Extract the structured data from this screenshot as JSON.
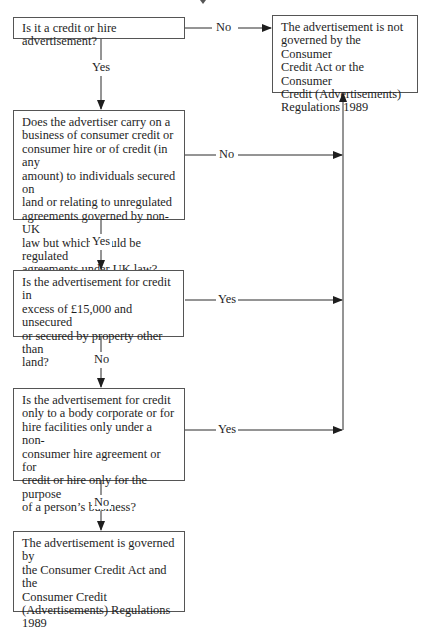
{
  "diagram": {
    "type": "flowchart",
    "title_fragment": "",
    "colors": {
      "line": "#2a2a2a",
      "box_border": "#555555",
      "text": "#1e1e1e",
      "background": "#ffffff"
    },
    "nodes": [
      {
        "id": "q1",
        "kind": "decision",
        "text": "Is it a credit or hire advertisement?"
      },
      {
        "id": "q2",
        "kind": "decision",
        "text": "Does the advertiser carry on a\nbusiness of consumer credit or\nconsumer hire or of credit (in any\namount) to individuals secured on\nland or relating to unregulated\nagreements governed by non-UK\nlaw but which would be regulated\nagreements under UK law?"
      },
      {
        "id": "q3",
        "kind": "decision",
        "text": "Is the advertisement for credit in\nexcess of £15,000 and unsecured\nor secured by property other than\nland?"
      },
      {
        "id": "q4",
        "kind": "decision",
        "text": "Is the advertisement for credit\nonly to a body corporate or for\nhire facilities only under a non-\nconsumer hire agreement or for\ncredit or hire only for the purpose\nof a person’s business?"
      },
      {
        "id": "not_governed",
        "kind": "outcome",
        "text": "The advertisement is not\ngoverned by the Consumer\nCredit Act or the Consumer\nCredit (Advertisements)\nRegulations 1989"
      },
      {
        "id": "governed",
        "kind": "outcome",
        "text": "The advertisement is governed by\nthe Consumer Credit Act and the\nConsumer Credit\n(Advertisements) Regulations\n1989"
      }
    ],
    "edges": [
      {
        "from": "q1",
        "to": "not_governed",
        "label": "No"
      },
      {
        "from": "q1",
        "to": "q2",
        "label": "Yes"
      },
      {
        "from": "q2",
        "to": "not_governed",
        "label": "No"
      },
      {
        "from": "q2",
        "to": "q3",
        "label": "Yes"
      },
      {
        "from": "q3",
        "to": "not_governed",
        "label": "Yes"
      },
      {
        "from": "q3",
        "to": "q4",
        "label": "No"
      },
      {
        "from": "q4",
        "to": "not_governed",
        "label": "Yes"
      },
      {
        "from": "q4",
        "to": "governed",
        "label": "No"
      }
    ]
  }
}
